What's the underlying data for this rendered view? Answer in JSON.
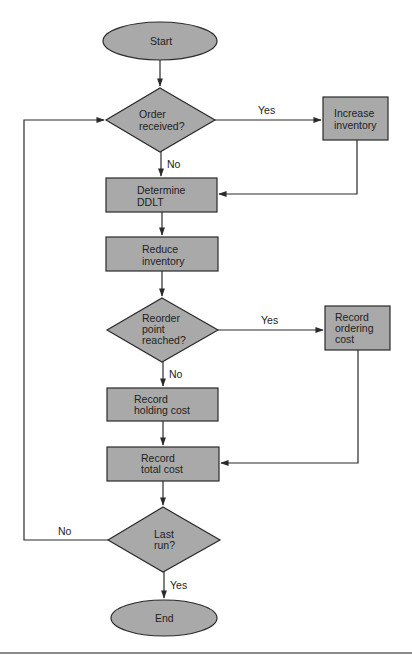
{
  "diagram": {
    "type": "flowchart",
    "fill_color": "#a9a9a9",
    "stroke_color": "#2a2a2a",
    "nodes": {
      "start": {
        "shape": "ellipse",
        "lines": [
          "Start"
        ]
      },
      "order_received": {
        "shape": "diamond",
        "lines": [
          "Order",
          "received?"
        ]
      },
      "increase_inventory": {
        "shape": "rect",
        "lines": [
          "Increase",
          "inventory"
        ]
      },
      "determine_ddlt": {
        "shape": "rect",
        "lines": [
          "Determine",
          "DDLT"
        ]
      },
      "reduce_inventory": {
        "shape": "rect",
        "lines": [
          "Reduce",
          "inventory"
        ]
      },
      "reorder_point": {
        "shape": "diamond",
        "lines": [
          "Reorder",
          "point",
          "reached?"
        ]
      },
      "record_ordering_cost": {
        "shape": "rect",
        "lines": [
          "Record",
          "ordering",
          "cost"
        ]
      },
      "record_holding_cost": {
        "shape": "rect",
        "lines": [
          "Record",
          "holding cost"
        ]
      },
      "record_total_cost": {
        "shape": "rect",
        "lines": [
          "Record",
          "total cost"
        ]
      },
      "last_run": {
        "shape": "diamond",
        "lines": [
          "Last",
          "run?"
        ]
      },
      "end": {
        "shape": "ellipse",
        "lines": [
          "End"
        ]
      }
    },
    "edges": [
      {
        "from": "start",
        "to": "order_received",
        "label": ""
      },
      {
        "from": "order_received",
        "to": "increase_inventory",
        "label": "Yes"
      },
      {
        "from": "order_received",
        "to": "determine_ddlt",
        "label": "No"
      },
      {
        "from": "increase_inventory",
        "to": "determine_ddlt",
        "label": ""
      },
      {
        "from": "determine_ddlt",
        "to": "reduce_inventory",
        "label": ""
      },
      {
        "from": "reduce_inventory",
        "to": "reorder_point",
        "label": ""
      },
      {
        "from": "reorder_point",
        "to": "record_ordering_cost",
        "label": "Yes"
      },
      {
        "from": "reorder_point",
        "to": "record_holding_cost",
        "label": "No"
      },
      {
        "from": "record_ordering_cost",
        "to": "record_total_cost",
        "label": ""
      },
      {
        "from": "record_holding_cost",
        "to": "record_total_cost",
        "label": ""
      },
      {
        "from": "record_total_cost",
        "to": "last_run",
        "label": ""
      },
      {
        "from": "last_run",
        "to": "order_received",
        "label": "No"
      },
      {
        "from": "last_run",
        "to": "end",
        "label": "Yes"
      }
    ],
    "edge_labels": {
      "order_yes": "Yes",
      "order_no": "No",
      "reorder_yes": "Yes",
      "reorder_no": "No",
      "last_no": "No",
      "last_yes": "Yes"
    }
  }
}
